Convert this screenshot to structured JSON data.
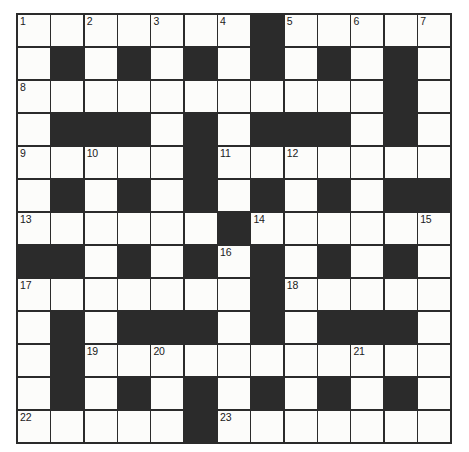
{
  "puzzle": {
    "title": "Crossword Grid",
    "type": "crossword-grid",
    "rows": 13,
    "columns": 13,
    "cell_size_px": 33,
    "colors": {
      "block": "#2b2b2b",
      "open": "#fcfcfa",
      "border": "#2b2b2b",
      "number_text": "#1a1a1a",
      "page_background": "#ffffff"
    },
    "grid": [
      [
        "open",
        "open",
        "open",
        "open",
        "open",
        "open",
        "open",
        "block",
        "open",
        "open",
        "open",
        "open",
        "open"
      ],
      [
        "open",
        "block",
        "open",
        "block",
        "open",
        "block",
        "open",
        "block",
        "open",
        "block",
        "open",
        "block",
        "open"
      ],
      [
        "open",
        "open",
        "open",
        "open",
        "open",
        "open",
        "open",
        "open",
        "open",
        "open",
        "open",
        "block",
        "open"
      ],
      [
        "open",
        "block",
        "block",
        "block",
        "open",
        "block",
        "open",
        "block",
        "block",
        "block",
        "open",
        "block",
        "open"
      ],
      [
        "open",
        "open",
        "open",
        "open",
        "open",
        "block",
        "open",
        "open",
        "open",
        "open",
        "open",
        "open",
        "open"
      ],
      [
        "open",
        "block",
        "open",
        "block",
        "open",
        "block",
        "open",
        "block",
        "open",
        "block",
        "open",
        "block",
        "block"
      ],
      [
        "open",
        "open",
        "open",
        "open",
        "open",
        "open",
        "block",
        "open",
        "open",
        "open",
        "open",
        "open",
        "open"
      ],
      [
        "block",
        "block",
        "open",
        "block",
        "open",
        "block",
        "open",
        "block",
        "open",
        "block",
        "open",
        "block",
        "open"
      ],
      [
        "open",
        "open",
        "open",
        "open",
        "open",
        "open",
        "open",
        "block",
        "open",
        "open",
        "open",
        "open",
        "open"
      ],
      [
        "open",
        "block",
        "open",
        "block",
        "block",
        "block",
        "open",
        "block",
        "open",
        "block",
        "block",
        "block",
        "open"
      ],
      [
        "open",
        "block",
        "open",
        "open",
        "open",
        "open",
        "open",
        "open",
        "open",
        "open",
        "open",
        "open",
        "open"
      ],
      [
        "open",
        "block",
        "open",
        "block",
        "open",
        "block",
        "open",
        "block",
        "open",
        "block",
        "open",
        "block",
        "open"
      ],
      [
        "open",
        "open",
        "open",
        "open",
        "open",
        "block",
        "open",
        "open",
        "open",
        "open",
        "open",
        "open",
        "open"
      ]
    ],
    "numbers": [
      {
        "number": "1",
        "row": 0,
        "col": 0
      },
      {
        "number": "2",
        "row": 0,
        "col": 2
      },
      {
        "number": "3",
        "row": 0,
        "col": 4
      },
      {
        "number": "4",
        "row": 0,
        "col": 6
      },
      {
        "number": "5",
        "row": 0,
        "col": 8
      },
      {
        "number": "6",
        "row": 0,
        "col": 10
      },
      {
        "number": "7",
        "row": 0,
        "col": 12
      },
      {
        "number": "8",
        "row": 2,
        "col": 0
      },
      {
        "number": "9",
        "row": 4,
        "col": 0
      },
      {
        "number": "10",
        "row": 4,
        "col": 2
      },
      {
        "number": "11",
        "row": 4,
        "col": 6
      },
      {
        "number": "12",
        "row": 4,
        "col": 8
      },
      {
        "number": "13",
        "row": 6,
        "col": 0
      },
      {
        "number": "14",
        "row": 6,
        "col": 7
      },
      {
        "number": "15",
        "row": 6,
        "col": 12
      },
      {
        "number": "16",
        "row": 7,
        "col": 6
      },
      {
        "number": "17",
        "row": 8,
        "col": 0
      },
      {
        "number": "18",
        "row": 8,
        "col": 8
      },
      {
        "number": "19",
        "row": 10,
        "col": 2
      },
      {
        "number": "20",
        "row": 10,
        "col": 4
      },
      {
        "number": "21",
        "row": 10,
        "col": 10
      },
      {
        "number": "22",
        "row": 12,
        "col": 0
      },
      {
        "number": "23",
        "row": 12,
        "col": 6
      }
    ],
    "letters": []
  }
}
